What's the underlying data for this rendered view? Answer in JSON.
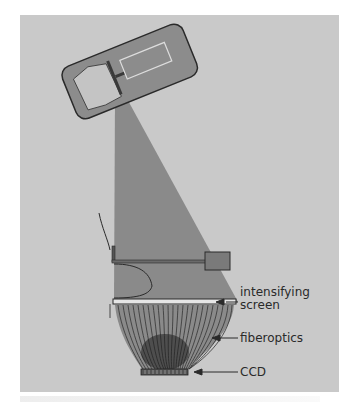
{
  "figure": {
    "labels": {
      "intensifying_screen": "intensifying\nscreen",
      "intensifying_line1": "intensifying",
      "intensifying_line2": "screen",
      "fiberoptics": "fiberoptics",
      "ccd": "CCD"
    },
    "components": [
      {
        "name": "x-ray-tube",
        "labeled": false
      },
      {
        "name": "x-ray-beam",
        "labeled": false
      },
      {
        "name": "compression-paddle",
        "labeled": false
      },
      {
        "name": "breast",
        "labeled": false
      },
      {
        "name": "intensifying-screen",
        "labeled": true
      },
      {
        "name": "fiberoptics",
        "labeled": true
      },
      {
        "name": "ccd",
        "labeled": true
      }
    ],
    "colors": {
      "background_panel": "#c9c9c9",
      "beam": "#8a8a8a",
      "tube_housing": "#8c8c8c",
      "outline": "#2a2a2a",
      "ccd": "#555555"
    }
  }
}
